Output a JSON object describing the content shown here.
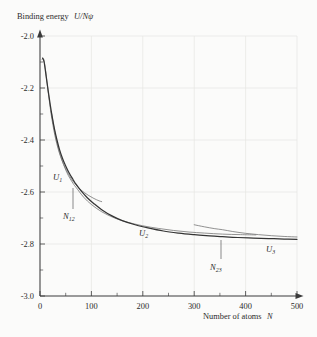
{
  "figure": {
    "background_color": "#fbfbfa",
    "ink_color": "#2b2b2b",
    "grid_color": "#e3e3e1"
  },
  "axes": {
    "y_title": "Binding energy U/Nψ",
    "y_title_plain": "Binding energy",
    "y_title_symbol": "U/Nψ",
    "x_title": "Number of atoms N",
    "x_title_plain": "Number of atoms",
    "x_title_symbol": "N",
    "y_ticks": [
      "-2.0",
      "-2.2",
      "-2.4",
      "-2.6",
      "-2.8",
      "-3.0"
    ],
    "x_ticks": [
      "0",
      "100",
      "200",
      "300",
      "400",
      "500"
    ]
  },
  "annotations": {
    "u1": {
      "base": "U",
      "sub": "1"
    },
    "u2": {
      "base": "U",
      "sub": "2"
    },
    "u3": {
      "base": "U",
      "sub": "3"
    },
    "n12": {
      "base": "N",
      "sub": "12"
    },
    "n23": {
      "base": "N",
      "sub": "23"
    }
  },
  "chart_data": {
    "type": "line",
    "title": "",
    "xlabel": "Number of atoms N",
    "ylabel": "Binding energy U/Nψ",
    "xlim": [
      0,
      500
    ],
    "ylim": [
      -3.0,
      -2.0
    ],
    "xticks": [
      0,
      100,
      200,
      300,
      400,
      500
    ],
    "yticks": [
      -3.0,
      -2.8,
      -2.6,
      -2.4,
      -2.2,
      -2.0
    ],
    "xminor_step": 50,
    "yminor_step": 0.05,
    "grid": true,
    "legend": "none",
    "axis_arrows": true,
    "crossovers": [
      {
        "name": "N12",
        "x": 70,
        "y": -2.6
      },
      {
        "name": "N23",
        "x": 355,
        "y": -2.745
      }
    ],
    "series": [
      {
        "name": "U1",
        "label": "U₁",
        "role": "branch-1",
        "x": [
          4,
          7,
          10,
          13,
          16,
          19,
          22,
          26,
          30,
          35,
          40,
          46,
          52,
          58,
          64,
          70,
          78,
          86,
          95,
          105,
          115,
          120
        ],
        "y": [
          -2.09,
          -2.088,
          -2.12,
          -2.168,
          -2.216,
          -2.262,
          -2.305,
          -2.352,
          -2.392,
          -2.432,
          -2.464,
          -2.494,
          -2.518,
          -2.54,
          -2.558,
          -2.572,
          -2.589,
          -2.602,
          -2.614,
          -2.625,
          -2.634,
          -2.637
        ]
      },
      {
        "name": "U2",
        "label": "U₂",
        "role": "branch-2",
        "x": [
          22,
          30,
          40,
          52,
          64,
          70,
          85,
          100,
          120,
          145,
          170,
          200,
          230,
          260,
          290,
          320,
          355,
          390,
          420
        ],
        "y": [
          -2.292,
          -2.382,
          -2.46,
          -2.524,
          -2.566,
          -2.582,
          -2.62,
          -2.648,
          -2.676,
          -2.7,
          -2.716,
          -2.73,
          -2.74,
          -2.748,
          -2.754,
          -2.758,
          -2.762,
          -2.764,
          -2.765
        ]
      },
      {
        "name": "U3",
        "label": "U₃",
        "role": "branch-3",
        "x": [
          300,
          320,
          340,
          355,
          375,
          400,
          425,
          450,
          475,
          500
        ],
        "y": [
          -2.726,
          -2.734,
          -2.741,
          -2.745,
          -2.752,
          -2.759,
          -2.764,
          -2.768,
          -2.771,
          -2.773
        ]
      },
      {
        "name": "envelope",
        "label": "",
        "role": "lower-envelope",
        "x": [
          5,
          8,
          12,
          16,
          20,
          24,
          28,
          33,
          38,
          44,
          50,
          57,
          64,
          70,
          80,
          92,
          105,
          120,
          140,
          160,
          185,
          210,
          240,
          270,
          300,
          330,
          355,
          385,
          415,
          445,
          475,
          500
        ],
        "y": [
          -2.085,
          -2.1,
          -2.155,
          -2.212,
          -2.266,
          -2.314,
          -2.356,
          -2.4,
          -2.437,
          -2.472,
          -2.5,
          -2.528,
          -2.551,
          -2.57,
          -2.596,
          -2.622,
          -2.645,
          -2.668,
          -2.692,
          -2.71,
          -2.726,
          -2.738,
          -2.75,
          -2.758,
          -2.764,
          -2.769,
          -2.772,
          -2.775,
          -2.777,
          -2.779,
          -2.781,
          -2.782
        ]
      }
    ]
  }
}
